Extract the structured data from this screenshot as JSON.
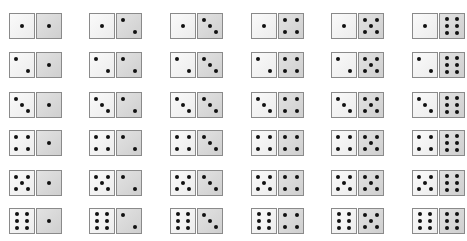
{
  "colors": {
    "left_die_face": "#f0f0f0",
    "right_die_face": "#d6d6d6",
    "die_border": "#8a8a8a",
    "pip": "#111111",
    "background": "#ffffff"
  },
  "grid": {
    "rows": 6,
    "cols": 6,
    "col_x": [
      9,
      89,
      170,
      251,
      331,
      412
    ],
    "row_y": [
      13,
      52,
      92,
      130,
      170,
      208
    ],
    "outcomes": [
      [
        [
          1,
          1
        ],
        [
          1,
          2
        ],
        [
          1,
          3
        ],
        [
          1,
          4
        ],
        [
          1,
          5
        ],
        [
          1,
          6
        ]
      ],
      [
        [
          2,
          1
        ],
        [
          2,
          2
        ],
        [
          2,
          3
        ],
        [
          2,
          4
        ],
        [
          2,
          5
        ],
        [
          2,
          6
        ]
      ],
      [
        [
          3,
          1
        ],
        [
          3,
          2
        ],
        [
          3,
          3
        ],
        [
          3,
          4
        ],
        [
          3,
          5
        ],
        [
          3,
          6
        ]
      ],
      [
        [
          4,
          1
        ],
        [
          4,
          2
        ],
        [
          4,
          3
        ],
        [
          4,
          4
        ],
        [
          4,
          5
        ],
        [
          4,
          6
        ]
      ],
      [
        [
          5,
          1
        ],
        [
          5,
          2
        ],
        [
          5,
          3
        ],
        [
          5,
          4
        ],
        [
          5,
          5
        ],
        [
          5,
          6
        ]
      ],
      [
        [
          6,
          1
        ],
        [
          6,
          2
        ],
        [
          6,
          3
        ],
        [
          6,
          4
        ],
        [
          6,
          5
        ],
        [
          6,
          6
        ]
      ]
    ]
  }
}
